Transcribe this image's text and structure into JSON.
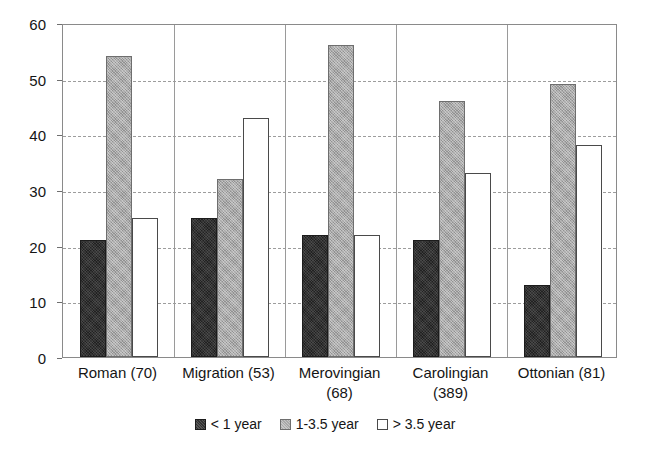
{
  "chart_data": {
    "type": "bar",
    "title": "",
    "subtitle": "",
    "xlabel": "",
    "ylabel": "",
    "ylim": [
      0,
      60
    ],
    "ytick_step": 10,
    "yticks": [
      0,
      10,
      20,
      30,
      40,
      50,
      60
    ],
    "ytick_labels": [
      "0",
      "10",
      "20",
      "30",
      "40",
      "50",
      "60"
    ],
    "grid": true,
    "grid_axis": "y",
    "legend_position": "bottom-center",
    "orientation": "vertical",
    "grouping": "grouped",
    "categories": [
      "Roman (70)",
      "Migration (53)",
      "Merovingian (68)",
      "Carolingian (389)",
      "Ottonian (81)"
    ],
    "category_lines": [
      [
        "Roman (70)"
      ],
      [
        "Migration (53)"
      ],
      [
        "Merovingian",
        "(68)"
      ],
      [
        "Carolingian",
        "(389)"
      ],
      [
        "Ottonian (81)"
      ]
    ],
    "series": [
      {
        "name": "< 1 year",
        "color": "#333333",
        "values": [
          21,
          25,
          22,
          21,
          13
        ]
      },
      {
        "name": "1-3.5 year",
        "color": "#a9a9a9",
        "values": [
          54,
          32,
          56,
          46,
          49
        ]
      },
      {
        "name": "> 3.5 year",
        "color": "#ffffff",
        "values": [
          25,
          43,
          22,
          33,
          38
        ]
      }
    ]
  },
  "legend": {
    "items": [
      {
        "label": "< 1 year"
      },
      {
        "label": "1-3.5 year"
      },
      {
        "label": "> 3.5 year"
      }
    ]
  },
  "colors": {
    "series_dark": "#333333",
    "series_gray": "#a9a9a9",
    "series_white": "#ffffff",
    "axis": "#8a8a8a",
    "grid": "#9d9d9d",
    "text": "#151515",
    "background": "#ffffff"
  }
}
